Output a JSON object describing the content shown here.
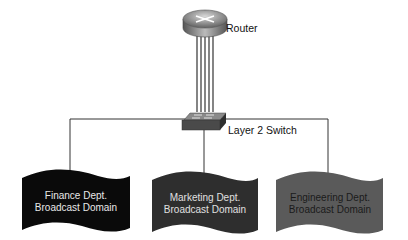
{
  "nodes": {
    "router": {
      "label": "Router"
    },
    "switch": {
      "label": "Layer 2 Switch"
    }
  },
  "domains": [
    {
      "line1": "Finance Dept.",
      "line2": "Broadcast Domain",
      "fill": "#0a0a0a",
      "text_color": "#e8e8e8"
    },
    {
      "line1": "Marketing Dept.",
      "line2": "Broadcast Domain",
      "fill": "#2e2e2e",
      "text_color": "#e0e0e0"
    },
    {
      "line1": "Engineering Dept.",
      "line2": "Broadcast Domain",
      "fill": "#5a5a5a",
      "text_color": "#1a1a1a"
    }
  ],
  "links": {
    "router_to_switch_count": 5
  }
}
